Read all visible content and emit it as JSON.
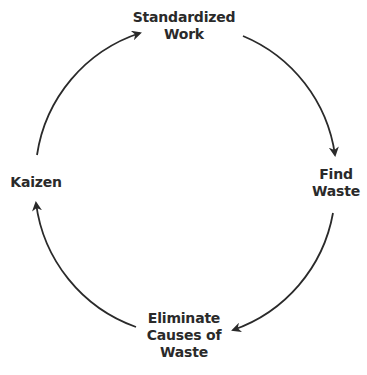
{
  "diagram": {
    "type": "cycle",
    "stroke_color": "#2a2a2a",
    "nodes": [
      {
        "id": "standardized-work",
        "lines": [
          "Standardized",
          "Work"
        ]
      },
      {
        "id": "find-waste",
        "lines": [
          "Find",
          "Waste"
        ]
      },
      {
        "id": "eliminate-causes",
        "lines": [
          "Eliminate",
          "Causes of",
          "Waste"
        ]
      },
      {
        "id": "kaizen",
        "lines": [
          "Kaizen"
        ]
      }
    ],
    "edges": [
      {
        "from": "standardized-work",
        "to": "find-waste"
      },
      {
        "from": "find-waste",
        "to": "eliminate-causes"
      },
      {
        "from": "eliminate-causes",
        "to": "kaizen"
      },
      {
        "from": "kaizen",
        "to": "standardized-work"
      }
    ]
  }
}
